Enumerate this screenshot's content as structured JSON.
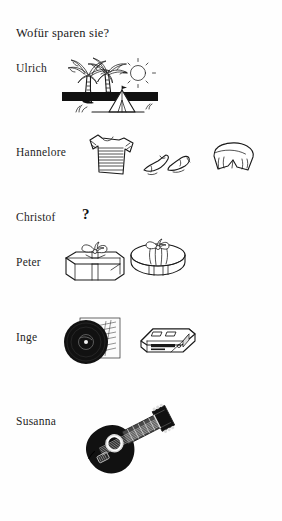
{
  "page": {
    "heading": "Wofür sparen sie?",
    "language": "de",
    "ink_color": "#1a1a1a",
    "paper_color": "#fefefe"
  },
  "rows": [
    {
      "name": "Ulrich",
      "answer_unknown": false,
      "items": [
        {
          "icon": "palm-tree-beach-tent-icon",
          "label": "Urlaub"
        }
      ]
    },
    {
      "name": "Hannelore",
      "answer_unknown": false,
      "items": [
        {
          "icon": "t-shirt-icon",
          "label": "T-Shirt"
        },
        {
          "icon": "shoes-icon",
          "label": "Schuhe"
        },
        {
          "icon": "shorts-icon",
          "label": "Shorts"
        }
      ]
    },
    {
      "name": "Christof",
      "answer_unknown": true,
      "unknown_marker": "?",
      "items": []
    },
    {
      "name": "Peter",
      "answer_unknown": false,
      "items": [
        {
          "icon": "square-gift-box-icon",
          "label": "Geschenk"
        },
        {
          "icon": "round-gift-box-icon",
          "label": "Geschenk"
        }
      ]
    },
    {
      "name": "Inge",
      "answer_unknown": false,
      "items": [
        {
          "icon": "vinyl-record-icon",
          "label": "Schallplatte"
        },
        {
          "icon": "cd-player-icon",
          "label": "CD-Spieler"
        }
      ]
    },
    {
      "name": "Susanna",
      "answer_unknown": false,
      "items": [
        {
          "icon": "acoustic-guitar-icon",
          "label": "Gitarre"
        }
      ]
    }
  ]
}
